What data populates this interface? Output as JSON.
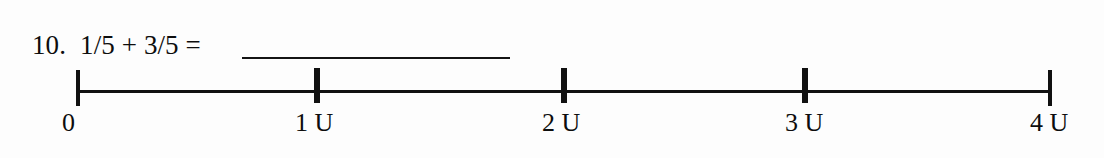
{
  "worksheet": {
    "problem_number": "10.",
    "expression": "1/5 + 3/5 =",
    "answer_value": ""
  },
  "number_line": {
    "start_label": "0",
    "ticks": [
      {
        "label": "0",
        "value": 0,
        "x": 78,
        "label_x": 62,
        "type": "end"
      },
      {
        "label": "1 U",
        "value": 1,
        "x": 317,
        "label_x": 295,
        "type": "inner"
      },
      {
        "label": "2 U",
        "value": 2,
        "x": 564,
        "label_x": 542,
        "type": "inner"
      },
      {
        "label": "3 U",
        "value": 3,
        "x": 805,
        "label_x": 785,
        "type": "inner"
      },
      {
        "label": "4 U",
        "value": 4,
        "x": 1050,
        "label_x": 1030,
        "type": "end"
      }
    ],
    "unit_symbol": "U",
    "range_min": 0,
    "range_max": 4
  },
  "colors": {
    "ink": "#111111",
    "paper": "#fdfdfd"
  }
}
